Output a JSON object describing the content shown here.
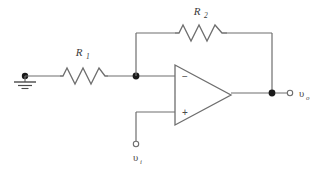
{
  "diagram": {
    "background_color": "#ffffff",
    "wire_color": "#6e6e6e",
    "node_color": "#1a1a1a",
    "text_color": "#3a3a3a"
  },
  "components": {
    "resistor_r1": {
      "label": "R",
      "subscript": "1",
      "x": 60,
      "y": 76,
      "width": 48
    },
    "resistor_r2": {
      "label": "R",
      "subscript": "2",
      "x": 175,
      "y": 33,
      "width": 52
    },
    "opamp": {
      "inverting_pin": "−",
      "noninverting_pin": "+",
      "x": 175,
      "y": 65,
      "width": 56,
      "height": 60
    },
    "ground": {
      "name": "ground-symbol",
      "x": 25,
      "y": 76
    }
  },
  "terminals": {
    "output": {
      "label": "υ",
      "subscript": "o",
      "x": 290,
      "y": 92
    },
    "input": {
      "label": "υ",
      "subscript": "i",
      "x": 136,
      "y": 150
    }
  },
  "nodes": {
    "inverting_node": {
      "x": 136,
      "y": 76
    },
    "output_node": {
      "x": 272,
      "y": 92
    },
    "ground_node": {
      "x": 25,
      "y": 76
    }
  }
}
